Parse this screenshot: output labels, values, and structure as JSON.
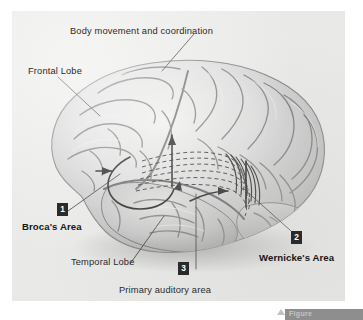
{
  "figure": {
    "background_color": "#e9e9e7",
    "ink_color": "#2b2b2b",
    "badge_color": "#2a2a2a",
    "badge_text_color": "#ffffff"
  },
  "labels": {
    "body_movement": "Body movement and coordination",
    "frontal_lobe": "Frontal Lobe",
    "brocas_area": "Broca's Area",
    "wernickes_area": "Wernicke's Area",
    "temporal_lobe": "Temporal Lobe",
    "primary_auditory_area": "Primary auditory area"
  },
  "badges": {
    "one": "1",
    "two": "2",
    "three": "3"
  },
  "caption": {
    "text": "Figure"
  }
}
